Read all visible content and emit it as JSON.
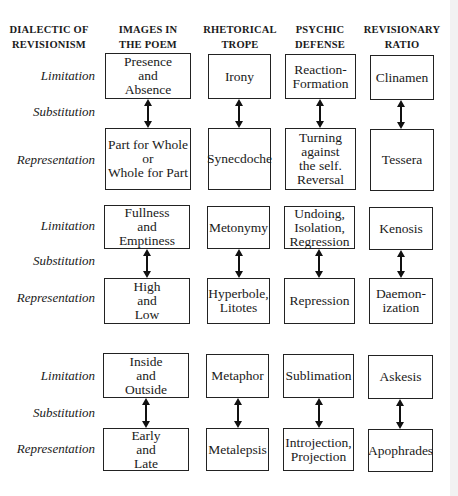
{
  "headers": {
    "col0": "DIALECTIC OF\nREVISIONISM",
    "col1": "IMAGES IN\nTHE POEM",
    "col2": "RHETORICAL\nTROPE",
    "col3": "PSYCHIC\nDEFENSE",
    "col4": "REVISIONARY\nRATIO"
  },
  "groups": [
    {
      "labels": {
        "limitation": "Limitation",
        "substitution": "Substitution",
        "representation": "Representation"
      },
      "top": {
        "image": "Presence\nand\nAbsence",
        "trope": "Irony",
        "defense": "Reaction-\nFormation",
        "ratio": "Clinamen"
      },
      "bottom": {
        "image": "Part for Whole\nor\nWhole for Part",
        "trope": "Synecdoche",
        "defense": "Turning\nagainst\nthe self.\nReversal",
        "ratio": "Tessera"
      }
    },
    {
      "labels": {
        "limitation": "Limitation",
        "substitution": "Substitution",
        "representation": "Representation"
      },
      "top": {
        "image": "Fullness\nand\nEmptiness",
        "trope": "Metonymy",
        "defense": "Undoing,\nIsolation,\nRegression",
        "ratio": "Kenosis"
      },
      "bottom": {
        "image": "High\nand\nLow",
        "trope": "Hyperbole,\nLitotes",
        "defense": "Repression",
        "ratio": "Daemon-\nization"
      }
    },
    {
      "labels": {
        "limitation": "Limitation",
        "substitution": "Substitution",
        "representation": "Representation"
      },
      "top": {
        "image": "Inside\nand\nOutside",
        "trope": "Metaphor",
        "defense": "Sublimation",
        "ratio": "Askesis"
      },
      "bottom": {
        "image": "Early\nand\nLate",
        "trope": "Metalepsis",
        "defense": "Introjection,\nProjection",
        "ratio": "Apophrades"
      }
    }
  ],
  "connectors": {
    "style": "double-headed-arrow",
    "color": "#111111"
  }
}
